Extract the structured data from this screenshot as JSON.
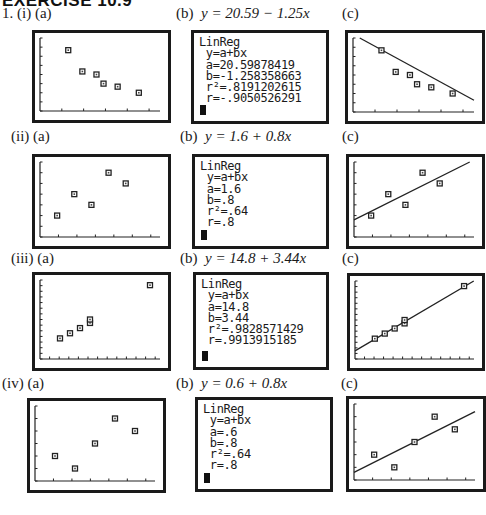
{
  "heading": "EXERCISE 10.9",
  "rows": [
    {
      "label_a": "1. (i) (a)",
      "label_b_prefix": "(b)",
      "equation": "y = 20.59 − 1.25x",
      "label_c": "(c)",
      "screen": [
        "LinReg",
        " y=a+bx",
        " a=20.59878419",
        " b=-1.258358663",
        " r²=.8191202615",
        " r=-.9050526291"
      ]
    },
    {
      "label_a": "(ii) (a)",
      "label_b_prefix": "(b)",
      "equation": "y = 1.6 + 0.8x",
      "label_c": "(c)",
      "screen": [
        "LinReg",
        " y=a+bx",
        " a=1.6",
        " b=.8",
        " r²=.64",
        " r=.8"
      ]
    },
    {
      "label_a": "(iii) (a)",
      "label_b_prefix": "(b)",
      "equation": "y = 14.8 + 3.44x",
      "label_c": "(c)",
      "screen": [
        "LinReg",
        " y=a+bx",
        " a=14.8",
        " b=3.44",
        " r²=.9828571429",
        " r=.9913915185"
      ]
    },
    {
      "label_a": "(iv) (a)",
      "label_b_prefix": "(b)",
      "equation": "y = 0.6 + 0.8x",
      "label_c": "(c)",
      "screen": [
        "LinReg",
        " y=a+bx",
        " a=.6",
        " b=.8",
        " r²=.64",
        " r=.8"
      ]
    }
  ],
  "chart_data": [
    {
      "type": "scatter",
      "title": "(i) scatter plot with regression line",
      "x": [
        2,
        3,
        4,
        4.5,
        5.5,
        7
      ],
      "y": [
        18,
        14.5,
        14,
        12.5,
        12,
        11
      ],
      "regression": {
        "a": 20.59878419,
        "b": -1.258358663,
        "r2": 0.8191202615,
        "r": -0.9050526291
      },
      "xlim": [
        0,
        8.5
      ],
      "ylim": [
        8,
        20
      ],
      "x_ticks": 5,
      "y_ticks": 8,
      "grid": false
    },
    {
      "type": "scatter",
      "title": "(ii) scatter plot with regression line",
      "x": [
        1,
        2,
        3,
        4,
        5
      ],
      "y": [
        2,
        4,
        3,
        6,
        5
      ],
      "regression": {
        "a": 1.6,
        "b": 0.8,
        "r2": 0.64,
        "r": 0.8
      },
      "xlim": [
        0,
        7
      ],
      "ylim": [
        0,
        7
      ],
      "x_ticks": 6,
      "y_ticks": 7,
      "grid": false
    },
    {
      "type": "scatter",
      "title": "(iii) scatter plot with regression line",
      "x": [
        2,
        3,
        4,
        5,
        5,
        11
      ],
      "y": [
        22,
        25,
        28,
        31,
        33,
        53
      ],
      "regression": {
        "a": 14.8,
        "b": 3.44,
        "r2": 0.9828571429,
        "r": 0.9913915185
      },
      "xlim": [
        0,
        12
      ],
      "ylim": [
        10,
        56
      ],
      "x_ticks": 12,
      "y_ticks": 14,
      "grid": false
    },
    {
      "type": "scatter",
      "title": "(iv) scatter plot with regression line",
      "x": [
        1,
        2,
        3,
        4,
        5
      ],
      "y": [
        2,
        1,
        3,
        5,
        4
      ],
      "regression": {
        "a": 0.6,
        "b": 0.8,
        "r2": 0.64,
        "r": 0.8
      },
      "xlim": [
        0,
        6
      ],
      "ylim": [
        0,
        6
      ],
      "x_ticks": 6,
      "y_ticks": 6,
      "grid": false
    }
  ]
}
